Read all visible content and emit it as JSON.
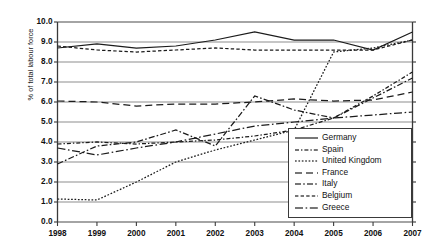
{
  "chart_data": {
    "type": "line",
    "title": "",
    "xlabel": "",
    "ylabel": "% of total labour force",
    "x": [
      1998,
      1999,
      2000,
      2001,
      2002,
      2003,
      2004,
      2005,
      2006,
      2007
    ],
    "xtick_labels": [
      "1998",
      "1999",
      "2000",
      "2001",
      "2002",
      "2003",
      "2004",
      "2005",
      "2006",
      "2007"
    ],
    "ytick_labels": [
      "0.0",
      "1.0",
      "2.0",
      "3.0",
      "4.0",
      "5.0",
      "6.0",
      "7.0",
      "8.0",
      "9.0",
      "10.0"
    ],
    "ylim": [
      0.0,
      10.0
    ],
    "ytick_step": 1.0,
    "grid": true,
    "grid_axis": "y",
    "legend_position": "bottom-right",
    "series": [
      {
        "name": "Germany",
        "style": "solid",
        "values": [
          8.7,
          8.9,
          8.7,
          8.8,
          9.1,
          9.5,
          9.1,
          9.1,
          8.6,
          9.5
        ]
      },
      {
        "name": "Spain",
        "style": "dash-dot-short",
        "values": [
          3.9,
          4.0,
          3.9,
          4.0,
          4.1,
          4.3,
          4.6,
          5.2,
          6.3,
          7.5
        ]
      },
      {
        "name": "United Kingdom",
        "style": "dotted",
        "values": [
          1.15,
          1.1,
          2.0,
          3.0,
          3.6,
          4.1,
          4.6,
          8.5,
          8.7,
          9.1
        ]
      },
      {
        "name": "France",
        "style": "dashed",
        "values": [
          6.05,
          6.0,
          5.8,
          5.9,
          5.9,
          6.0,
          6.15,
          6.05,
          6.1,
          6.5
        ]
      },
      {
        "name": "Italy",
        "style": "dash-dot",
        "values": [
          2.9,
          3.8,
          4.0,
          4.6,
          3.8,
          6.3,
          5.6,
          5.2,
          6.2,
          7.2
        ]
      },
      {
        "name": "Belgium",
        "style": "dense-dash",
        "values": [
          8.8,
          8.6,
          8.5,
          8.6,
          8.7,
          8.6,
          8.6,
          8.6,
          8.6,
          9.1
        ]
      },
      {
        "name": "Greece",
        "style": "dash-dot-long",
        "values": [
          3.7,
          3.35,
          3.7,
          4.0,
          4.4,
          4.8,
          5.0,
          5.2,
          5.35,
          5.5
        ]
      }
    ]
  },
  "legend": {
    "items": [
      {
        "label": "Germany"
      },
      {
        "label": "Spain"
      },
      {
        "label": "United Kingdom"
      },
      {
        "label": "France"
      },
      {
        "label": "Italy"
      },
      {
        "label": "Belgium"
      },
      {
        "label": "Greece"
      }
    ]
  }
}
